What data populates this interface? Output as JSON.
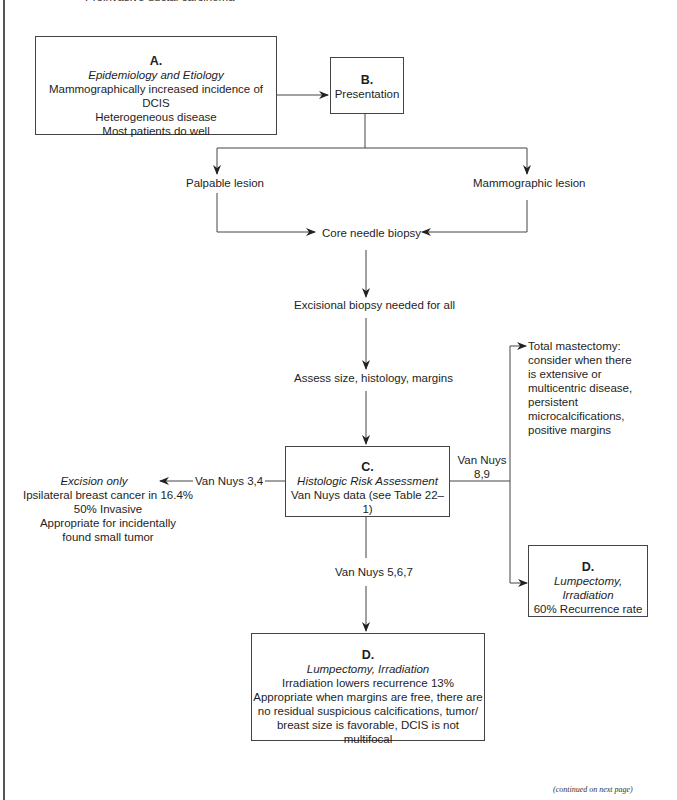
{
  "page": {
    "top_cutoff_text": "Preinvasive ductal carcinoma",
    "footer": "(continued on next page)"
  },
  "nodes": {
    "A": {
      "letter": "A.",
      "title": "Epidemiology and Etiology",
      "lines": [
        "Mammographically increased incidence of DCIS",
        "Heterogeneous disease",
        "Most patients do well"
      ]
    },
    "B": {
      "letter": "B.",
      "title": "Presentation"
    },
    "palpable": "Palpable lesion",
    "mammographic": "Mammographic lesion",
    "core_biopsy": "Core needle biopsy",
    "excisional_biopsy": "Excisional biopsy needed for all",
    "assess": "Assess size, histology, margins",
    "C": {
      "letter": "C.",
      "title": "Histologic Risk Assessment",
      "lines": [
        "Van Nuys data (see Table 22–1)"
      ]
    },
    "excision_only": {
      "title": "Excision only",
      "lines": [
        "Ipsilateral breast cancer in 16.4%",
        "50% Invasive",
        "Appropriate for incidentally",
        "found small tumor"
      ]
    },
    "total_mastectomy": {
      "lines": [
        "Total mastectomy:",
        "consider when there",
        "is extensive or",
        "multicentric disease,",
        "persistent",
        "microcalcifications,",
        "positive margins"
      ]
    },
    "D_right": {
      "letter": "D.",
      "title": "Lumpectomy, Irradiation",
      "lines": [
        "60% Recurrence rate"
      ]
    },
    "D_bottom": {
      "letter": "D.",
      "title": "Lumpectomy, Irradiation",
      "lines": [
        "Irradiation lowers recurrence 13%",
        "Appropriate when margins are free, there are",
        "no residual suspicious calcifications, tumor/",
        "breast size is favorable, DCIS is not multifocal"
      ]
    }
  },
  "edge_labels": {
    "van_nuys_34": "Van Nuys 3,4",
    "van_nuys_89_line1": "Van Nuys",
    "van_nuys_89_line2": "8,9",
    "van_nuys_567": "Van Nuys 5,6,7"
  },
  "colors": {
    "line": "#444444",
    "text": "#1e1e1e",
    "background": "#ffffff"
  }
}
